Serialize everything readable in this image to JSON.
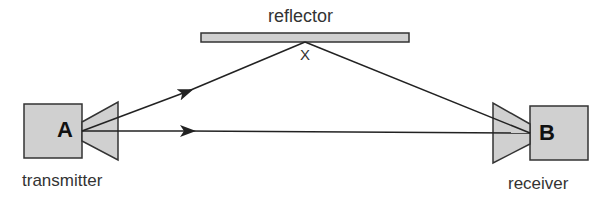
{
  "diagram": {
    "reflector": {
      "label": "reflector",
      "reflection_point_label": "X"
    },
    "transmitter": {
      "node_label": "A",
      "caption": "transmitter"
    },
    "receiver": {
      "node_label": "B",
      "caption": "receiver"
    },
    "paths": [
      {
        "name": "reflected-path",
        "from": "A",
        "via": "X",
        "to": "B"
      },
      {
        "name": "direct-path",
        "from": "A",
        "to": "B"
      }
    ],
    "colors": {
      "fill": "#d0d0d0",
      "stroke": "#333333"
    }
  }
}
